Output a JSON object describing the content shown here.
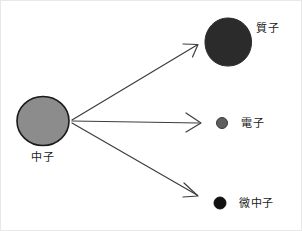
{
  "diagram": {
    "canvas": {
      "width": 302,
      "height": 231,
      "background": "#ffffff"
    },
    "source_particle": {
      "id": "neutron",
      "label": "中子",
      "shape": "circle",
      "fill": "#8c8c8c",
      "stroke": "#1a1a1a",
      "cx": 42,
      "cy": 120,
      "rx": 26,
      "ry": 24.5
    },
    "products": [
      {
        "id": "proton",
        "label": "質子",
        "shape": "circle",
        "fill": "#2b2b2b",
        "stroke": "#2b2b2b",
        "cx": 227,
        "cy": 41,
        "rx": 23,
        "ry": 24
      },
      {
        "id": "electron",
        "label": "電子",
        "shape": "circle",
        "fill": "#5e5e5e",
        "stroke": "#3a3a3a",
        "cx": 221,
        "cy": 122,
        "rx": 5.5,
        "ry": 5.5
      },
      {
        "id": "neutrino",
        "label": "微中子",
        "shape": "circle",
        "fill": "#111111",
        "stroke": "#111111",
        "cx": 219,
        "cy": 202,
        "rx": 6,
        "ry": 6
      }
    ],
    "arrows": [
      {
        "id": "arrow-to-proton",
        "x1": 71,
        "y1": 119,
        "x2": 196,
        "y2": 44,
        "color": "#3d3d3d",
        "width": 1.2
      },
      {
        "id": "arrow-to-electron",
        "x1": 71,
        "y1": 120,
        "x2": 199,
        "y2": 122,
        "color": "#3d3d3d",
        "width": 1.2
      },
      {
        "id": "arrow-to-neutrino",
        "x1": 71,
        "y1": 122,
        "x2": 196,
        "y2": 194,
        "color": "#3d3d3d",
        "width": 1.2
      }
    ]
  }
}
